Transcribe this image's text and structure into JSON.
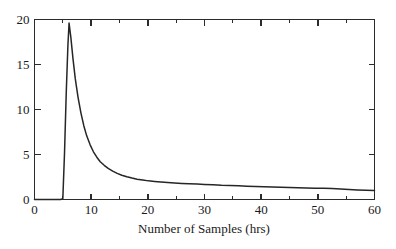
{
  "chart_data": {
    "type": "line",
    "title": "",
    "xlabel": "Number of Samples (hrs)",
    "ylabel": "",
    "xlim": [
      0,
      60
    ],
    "ylim": [
      0,
      20
    ],
    "grid": false,
    "legend": null,
    "x_ticks": [
      0,
      10,
      20,
      30,
      40,
      50,
      60
    ],
    "x_tick_labels": [
      "0",
      "10",
      "20",
      "30",
      "40",
      "50",
      "60"
    ],
    "x_minor_ticks": [
      5,
      15,
      25,
      35,
      45,
      55
    ],
    "y_ticks": [
      0,
      5,
      10,
      15,
      20
    ],
    "y_tick_labels": [
      "0",
      "5",
      "10",
      "15",
      "20"
    ],
    "line_color": "#262626",
    "frame_color": "#2b2b2b",
    "series": [
      {
        "name": "response",
        "x": [
          0,
          1,
          2,
          3,
          4,
          4.6,
          5.0,
          5.3,
          5.6,
          5.9,
          6.1,
          6.4,
          6.8,
          7.2,
          7.7,
          8.2,
          8.7,
          9.2,
          9.8,
          10.4,
          11.0,
          11.6,
          12.3,
          13.0,
          13.8,
          14.6,
          15.4,
          16.3,
          17.2,
          18.1,
          19.1,
          20.1,
          21.2,
          22.3,
          23.5,
          24.7,
          26.0,
          27.3,
          28.7,
          30.0,
          31.5,
          33.0,
          34.5,
          36.0,
          37.5,
          39.0,
          40.5,
          42.0,
          43.5,
          45.0,
          46.5,
          48.0,
          49.5,
          51.0,
          52.5,
          54.0,
          55.5,
          57.0,
          58.5,
          60.0
        ],
        "y": [
          0,
          0,
          0,
          0,
          0,
          0,
          0.1,
          5.2,
          11.8,
          17.2,
          19.6,
          18.1,
          15.6,
          13.4,
          11.3,
          9.6,
          8.2,
          7.1,
          6.1,
          5.3,
          4.7,
          4.2,
          3.8,
          3.45,
          3.15,
          2.9,
          2.7,
          2.52,
          2.38,
          2.26,
          2.16,
          2.07,
          2.0,
          1.94,
          1.88,
          1.83,
          1.79,
          1.75,
          1.71,
          1.68,
          1.63,
          1.58,
          1.56,
          1.52,
          1.47,
          1.44,
          1.42,
          1.38,
          1.35,
          1.33,
          1.3,
          1.28,
          1.26,
          1.24,
          1.21,
          1.18,
          1.12,
          1.06,
          1.02,
          1.0
        ]
      }
    ]
  },
  "axis_title": "Number of Samples (hrs)"
}
